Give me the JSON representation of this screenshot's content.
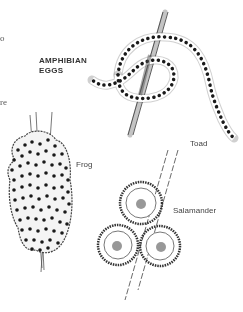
{
  "figure": {
    "title_line1": "AMPHIBIAN",
    "title_line2": "EGGS",
    "left_edge_fragments": [
      "o",
      "re"
    ],
    "labels": {
      "toad": "Toad",
      "frog": "Frog",
      "salamander": "Salamander"
    },
    "colors": {
      "ink": "#222222",
      "background": "#ffffff",
      "egg": "#1a1a1a"
    }
  }
}
